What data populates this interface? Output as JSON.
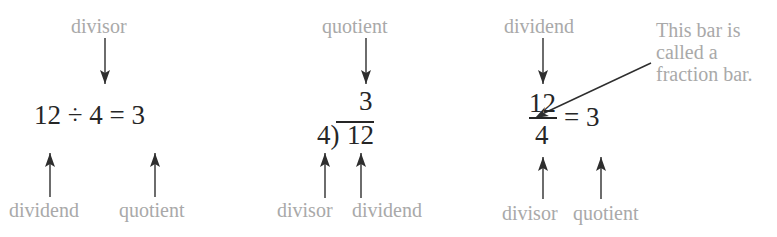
{
  "panel1": {
    "equation": "12 ÷ 4 = 3",
    "top_label": "divisor",
    "bottom_labels": [
      "dividend",
      "quotient"
    ]
  },
  "panel2": {
    "quotient": "3",
    "divisor_bracket": "4)",
    "dividend": "12",
    "top_label": "quotient",
    "bottom_labels": [
      "divisor",
      "dividend"
    ]
  },
  "panel3": {
    "numerator": "12",
    "denominator": "4",
    "equals": "= 3",
    "top_label": "dividend",
    "bottom_labels": [
      "divisor",
      "quotient"
    ],
    "note_lines": [
      "This bar is",
      "called a",
      "fraction bar."
    ]
  },
  "colors": {
    "label": "#a9a9a9",
    "math": "#262626",
    "arrow": "#2e2e2e"
  },
  "icons": {
    "arrow_down": "arrow-down-icon",
    "arrow_up": "arrow-up-icon",
    "arrow_diagonal": "arrow-diagonal-icon"
  }
}
